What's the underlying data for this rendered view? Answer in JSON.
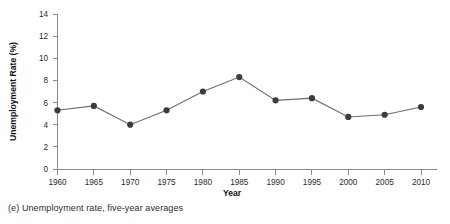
{
  "chart_data": {
    "type": "line",
    "title": "",
    "xlabel": "Year",
    "ylabel": "Unemployment Rate (%)",
    "x": [
      1960,
      1965,
      1970,
      1975,
      1980,
      1985,
      1990,
      1995,
      2000,
      2005,
      2010
    ],
    "values": [
      5.3,
      5.7,
      4.0,
      5.3,
      7.0,
      8.3,
      6.2,
      6.4,
      4.7,
      4.9,
      5.6
    ],
    "xtick_labels": [
      "1960",
      "1965",
      "1970",
      "1975",
      "1980",
      "1985",
      "1990",
      "1995",
      "2000",
      "2005",
      "2010"
    ],
    "ytick_labels": [
      "0",
      "2",
      "4",
      "6",
      "8",
      "10",
      "12",
      "14"
    ],
    "ytick_values": [
      0,
      2,
      4,
      6,
      8,
      10,
      12,
      14
    ],
    "ylim": [
      0,
      14
    ],
    "xlim": [
      1960,
      2010
    ],
    "grid": false,
    "legend": null,
    "series_color": "#3b3b42",
    "line_color": "#6b6b72",
    "axis_color": "#8a8a8a",
    "marker": "circle"
  },
  "caption": {
    "text": "(e) Unemployment rate, five-year averages"
  }
}
